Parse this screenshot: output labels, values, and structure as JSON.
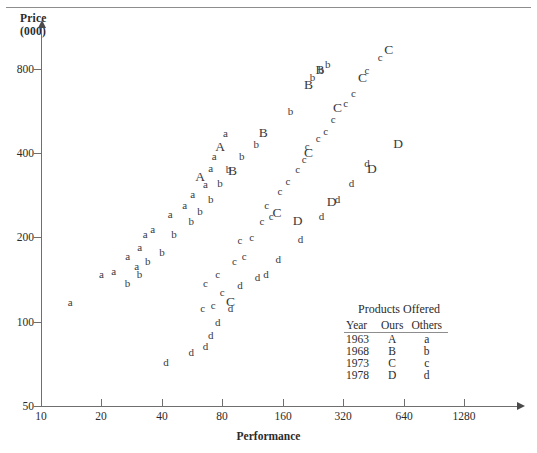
{
  "chart_data": {
    "type": "scatter",
    "title": "",
    "xlabel": "Performance",
    "ylabel": "Price",
    "ylabel_units": "(000)",
    "xscale": "log2",
    "yscale": "log2",
    "xlim": [
      10,
      2048
    ],
    "ylim": [
      50,
      1100
    ],
    "xticks": [
      10,
      20,
      40,
      80,
      160,
      320,
      640,
      1280
    ],
    "xtick_labels": [
      "10",
      "20",
      "40",
      "80",
      "160",
      "320",
      "640",
      "1280"
    ],
    "yticks": [
      50,
      100,
      200,
      400,
      800
    ],
    "ytick_labels": [
      "50",
      "100",
      "200",
      "400",
      "800"
    ],
    "grid": false,
    "legend_position": "inside-lower-right",
    "marker_color": "#3a3a40",
    "axis_color": "#6f6f6f",
    "series": [
      {
        "name": "1963 Ours",
        "marker": "A",
        "klass": "ours",
        "points": [
          [
            62,
            330
          ],
          [
            78,
            420
          ]
        ]
      },
      {
        "name": "1963 Others",
        "marker": "a",
        "klass": "others",
        "points": [
          [
            14,
            118
          ],
          [
            20,
            148
          ],
          [
            23,
            152
          ],
          [
            27,
            172
          ],
          [
            30,
            158
          ],
          [
            31,
            185
          ],
          [
            33,
            205
          ],
          [
            36,
            215
          ],
          [
            44,
            242
          ],
          [
            52,
            262
          ],
          [
            57,
            285
          ],
          [
            66,
            310
          ],
          [
            70,
            355
          ],
          [
            73,
            392
          ],
          [
            83,
            470
          ]
        ]
      },
      {
        "name": "1968 Ours",
        "marker": "B",
        "klass": "ours",
        "points": [
          [
            90,
            345
          ],
          [
            128,
            470
          ],
          [
            215,
            700
          ],
          [
            245,
            790
          ]
        ]
      },
      {
        "name": "1968 Others",
        "marker": "b",
        "klass": "others",
        "points": [
          [
            27,
            138
          ],
          [
            31,
            148
          ],
          [
            34,
            165
          ],
          [
            40,
            178
          ],
          [
            46,
            205
          ],
          [
            56,
            228
          ],
          [
            62,
            248
          ],
          [
            70,
            275
          ],
          [
            78,
            312
          ],
          [
            86,
            352
          ],
          [
            100,
            392
          ],
          [
            118,
            430
          ],
          [
            175,
            565
          ],
          [
            225,
            745
          ],
          [
            248,
            800
          ],
          [
            268,
            830
          ]
        ]
      },
      {
        "name": "1973 Ours",
        "marker": "C",
        "klass": "ours",
        "points": [
          [
            88,
            118
          ],
          [
            150,
            245
          ],
          [
            215,
            400
          ],
          [
            300,
            580
          ],
          [
            400,
            740
          ],
          [
            540,
            930
          ]
        ]
      },
      {
        "name": "1973 Others",
        "marker": "c",
        "klass": "others",
        "points": [
          [
            64,
            112
          ],
          [
            72,
            115
          ],
          [
            80,
            128
          ],
          [
            66,
            138
          ],
          [
            76,
            148
          ],
          [
            92,
            165
          ],
          [
            103,
            172
          ],
          [
            98,
            196
          ],
          [
            112,
            200
          ],
          [
            126,
            228
          ],
          [
            140,
            238
          ],
          [
            133,
            262
          ],
          [
            155,
            292
          ],
          [
            170,
            318
          ],
          [
            190,
            352
          ],
          [
            205,
            380
          ],
          [
            212,
            425
          ],
          [
            240,
            452
          ],
          [
            262,
            478
          ],
          [
            285,
            530
          ],
          [
            330,
            605
          ],
          [
            360,
            655
          ],
          [
            420,
            790
          ],
          [
            490,
            880
          ]
        ]
      },
      {
        "name": "1978 Ours",
        "marker": "D",
        "klass": "ours",
        "points": [
          [
            190,
            228
          ],
          [
            280,
            268
          ],
          [
            445,
            350
          ],
          [
            600,
            430
          ]
        ]
      },
      {
        "name": "1978 Others",
        "marker": "d",
        "klass": "others",
        "points": [
          [
            42,
            72
          ],
          [
            56,
            78
          ],
          [
            66,
            82
          ],
          [
            70,
            90
          ],
          [
            76,
            100
          ],
          [
            88,
            112
          ],
          [
            98,
            135
          ],
          [
            120,
            145
          ],
          [
            132,
            148
          ],
          [
            152,
            168
          ],
          [
            196,
            198
          ],
          [
            250,
            238
          ],
          [
            300,
            275
          ],
          [
            352,
            312
          ],
          [
            420,
            368
          ]
        ]
      }
    ]
  },
  "legend": {
    "title": "Products Offered",
    "headers": [
      "Year",
      "Ours",
      "Others"
    ],
    "rows": [
      [
        "1963",
        "A",
        "a"
      ],
      [
        "1968",
        "B",
        "b"
      ],
      [
        "1973",
        "C",
        "c"
      ],
      [
        "1978",
        "D",
        "d"
      ]
    ]
  }
}
